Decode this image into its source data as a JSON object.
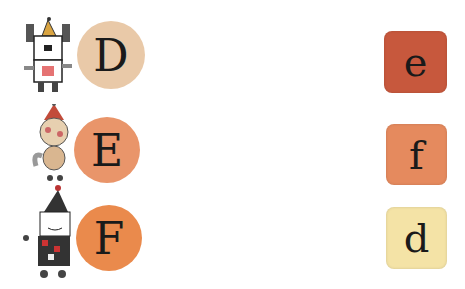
{
  "left_items": [
    {
      "letter": "D",
      "character": "dog-robot",
      "circle_color": "#e9c9a8"
    },
    {
      "letter": "E",
      "character": "cat",
      "circle_color": "#e9956a"
    },
    {
      "letter": "F",
      "character": "clown-checkered",
      "circle_color": "#ea8a4c"
    }
  ],
  "right_items": [
    {
      "letter": "e",
      "tile_color": "#c7583d"
    },
    {
      "letter": "f",
      "tile_color": "#e58a5e"
    },
    {
      "letter": "d",
      "tile_color": "#f4e3a6"
    }
  ]
}
